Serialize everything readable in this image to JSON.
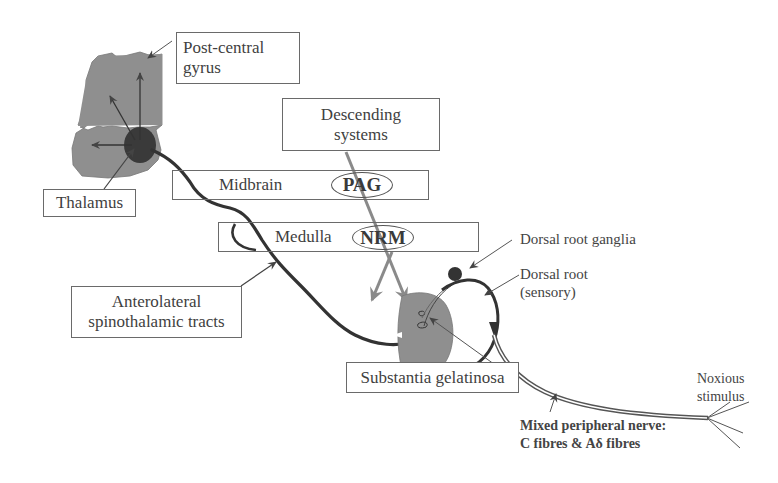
{
  "diagram": {
    "labels": {
      "post_central": [
        "Post-central",
        "gyrus"
      ],
      "descending": [
        "Descending",
        "systems"
      ],
      "thalamus": "Thalamus",
      "midbrain": "Midbrain",
      "pag": "PAG",
      "medulla": "Medulla",
      "nrm": "NRM",
      "anterolateral": [
        "Anterolateral",
        "spinothalamic tracts"
      ],
      "dorsal_root_ganglia": "Dorsal root ganglia",
      "dorsal_root": [
        "Dorsal root",
        "(sensory)"
      ],
      "substantia": "Substantia gelatinosa",
      "noxious": [
        "Noxious",
        "stimulus"
      ],
      "mixed_nerve": [
        "Mixed peripheral nerve:",
        "C fibres & Aδ fibres"
      ]
    },
    "colors": {
      "tissue": "#8f8f8f",
      "thalamus": "#3a3a3a",
      "tract": "#333333",
      "descending_arrow": "#8a8a8a",
      "box_border": "#6a6a6a"
    }
  }
}
